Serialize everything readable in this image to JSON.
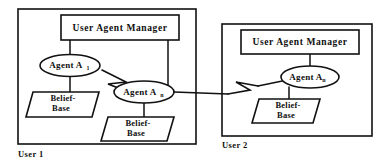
{
  "diagram": {
    "panels": [
      {
        "id": "user1",
        "caption": "User 1",
        "manager": {
          "label": "User Agent Manager"
        },
        "agents": [
          {
            "id": "agent-a1",
            "label": "Agent A",
            "subscript": "1"
          },
          {
            "id": "agent-an",
            "label": "Agent A",
            "subscript": "n"
          }
        ],
        "belief_bases": [
          {
            "id": "belief-base-1",
            "line1": "Belief-",
            "line2": "Base"
          },
          {
            "id": "belief-base-2",
            "line1": "Belief-",
            "line2": "Base"
          }
        ]
      },
      {
        "id": "user2",
        "caption": "User 2",
        "manager": {
          "label": "User Agent Manager"
        },
        "agents": [
          {
            "id": "agent-an-2",
            "label": "Agent A",
            "subscript": "n"
          }
        ],
        "belief_bases": [
          {
            "id": "belief-base-3",
            "line1": "Belief-",
            "line2": "Base"
          }
        ]
      }
    ],
    "colors": {
      "stroke": "#111111",
      "fill": "#ffffff",
      "text": "#101010"
    }
  }
}
